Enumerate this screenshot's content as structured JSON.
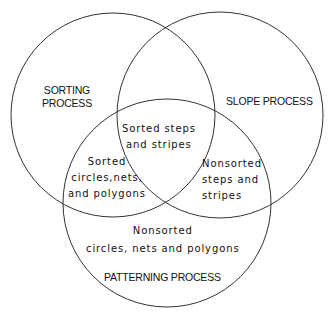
{
  "diagram": {
    "type": "venn",
    "circles": [
      {
        "id": "sorting",
        "label_lines": [
          "SORTING",
          "PROCESS"
        ],
        "cx": 113,
        "cy": 115,
        "r": 102
      },
      {
        "id": "slope",
        "label_lines": [
          "SLOPE PROCESS"
        ],
        "cx": 220,
        "cy": 115,
        "r": 103
      },
      {
        "id": "patterning",
        "label_lines": [
          "PATTERNING PROCESS"
        ],
        "cx": 167,
        "cy": 203,
        "r": 104
      }
    ],
    "stroke_color": "#333333",
    "regions": {
      "sorting_slope_patterning": {
        "lines": [
          "Sorted steps",
          "and stripes"
        ]
      },
      "sorting_patterning": {
        "lines": [
          "Sorted",
          "circles,nets,",
          "and polygons"
        ]
      },
      "slope_patterning": {
        "lines": [
          "Nonsorted",
          "steps and",
          "stripes"
        ]
      },
      "patterning_only": {
        "lines": [
          "Nonsorted",
          "circles, nets and polygons"
        ]
      }
    }
  }
}
